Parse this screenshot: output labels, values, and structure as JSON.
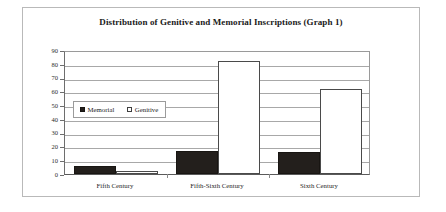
{
  "chart_data": {
    "type": "bar",
    "title": "Distribution of Genitive and Memorial Inscriptions (Graph 1)",
    "xlabel": "",
    "ylabel": "Number of Inscriptions",
    "categories": [
      "Fifth Century",
      "Fifth-Sixth Century",
      "Sixth Century"
    ],
    "series": [
      {
        "name": "Memorial",
        "values": [
          6,
          16.5,
          16
        ],
        "color": "#231f1c"
      },
      {
        "name": "Genitive",
        "values": [
          2,
          82,
          62
        ],
        "color": "#ffffff"
      }
    ],
    "ylim": [
      0,
      90
    ],
    "ytick_step": 10,
    "yticks": [
      90,
      80,
      70,
      60,
      50,
      40,
      30,
      20,
      10,
      0
    ],
    "ytick_labels": [
      "90",
      "80",
      "70",
      "60",
      "50",
      "40",
      "30",
      "20",
      "10",
      "0"
    ],
    "grid": true,
    "legend_position": "inside-left"
  },
  "legend": {
    "entries": [
      {
        "label": "Memorial",
        "swatch": "filled-square-black"
      },
      {
        "label": "Genitive",
        "swatch": "open-square-white"
      }
    ]
  }
}
